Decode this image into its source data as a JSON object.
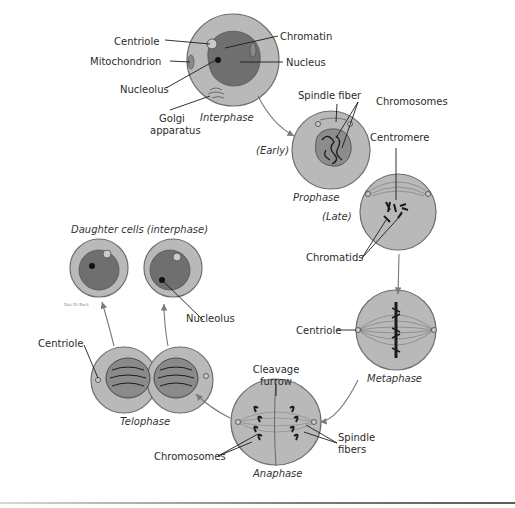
{
  "figure": {
    "colors": {
      "cytoplasm": "#b9b9b9",
      "cell_outline": "#6e6e6e",
      "nucleus": "#6f6f6f",
      "chromosome": "#1c1c1c",
      "arrow": "#7a7a7a",
      "label_text": "#2b2b2b"
    },
    "phases": {
      "interphase": "Interphase",
      "prophase": "Prophase",
      "prophase_early": "(Early)",
      "prophase_late": "(Late)",
      "metaphase": "Metaphase",
      "anaphase": "Anaphase",
      "telophase": "Telophase",
      "daughter_cells": "Daughter cells (interphase)"
    },
    "labels": {
      "centriole": "Centriole",
      "mitochondrion": "Mitochondrion",
      "nucleolus": "Nucleolus",
      "golgi_1": "Golgi",
      "golgi_2": "apparatus",
      "chromatin": "Chromatin",
      "nucleus": "Nucleus",
      "spindle_fiber": "Spindle fiber",
      "chromosomes_prophase": "Chromosomes",
      "centromere": "Centromere",
      "chromatids": "Chromatids",
      "centriole_metaphase": "Centriole",
      "cleavage_1": "Cleavage",
      "cleavage_2": "furrow",
      "spindle_fibers_1": "Spindle",
      "spindle_fibers_2": "fibers",
      "chromosomes_anaphase": "Chromosomes",
      "centriole_telophase": "Centriole",
      "nucleolus_daughter": "Nucleolus"
    },
    "signature": "Dav Dr Bock"
  }
}
